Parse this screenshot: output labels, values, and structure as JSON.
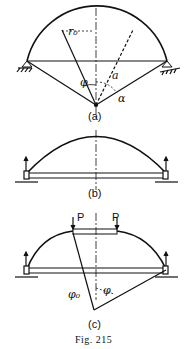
{
  "figure": {
    "caption": "Fig. 215",
    "panels": [
      {
        "id": "a",
        "label": "(a)",
        "symbols": {
          "r0": "r₀",
          "phi": "φ",
          "a": "a",
          "alpha": "α"
        }
      },
      {
        "id": "b",
        "label": "(b)"
      },
      {
        "id": "c",
        "label": "(c)",
        "loads": [
          "P",
          "P"
        ],
        "symbols": {
          "phi0": "φ₀",
          "phi": "φ"
        }
      }
    ]
  }
}
